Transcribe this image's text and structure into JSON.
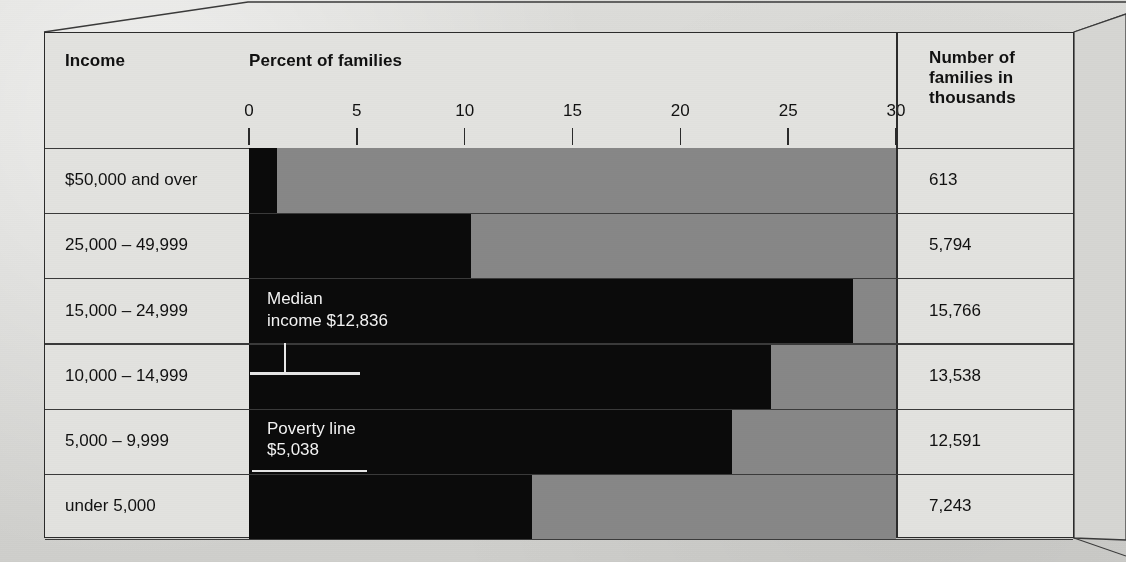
{
  "header": {
    "income_label": "Income",
    "percent_label": "Percent of families",
    "number_label": "Number of\nfamilies in\nthousands"
  },
  "annotations": {
    "median": {
      "text": "Median\nincome $12,836",
      "value": 12836,
      "label": "Median income"
    },
    "poverty": {
      "text": "Poverty line\n$5,038",
      "value": 5038,
      "label": "Poverty line"
    }
  },
  "colors": {
    "bar_dark": "#0b0b0b",
    "bar_light": "#878787",
    "paper": "#d8d8d6",
    "cell": "#e2e2df",
    "rule": "#2b2b2b",
    "annotation_text": "#f2f2f2"
  },
  "chart_data": {
    "type": "bar",
    "title": "Percent of families",
    "subtitle": "",
    "xlabel": "Percent of families",
    "ylabel": "Income",
    "orientation": "horizontal",
    "stacked": true,
    "grid": false,
    "legend": "none",
    "xlim": [
      0,
      30
    ],
    "xticks": [
      0,
      5,
      10,
      15,
      20,
      25,
      30
    ],
    "xtick_labels": [
      "0",
      "5",
      "10",
      "15",
      "20",
      "25",
      "30"
    ],
    "categories": [
      "$50,000 and over",
      "25,000 – 49,999",
      "15,000 – 24,999",
      "10,000 – 14,999",
      "5,000 – 9,999",
      "under 5,000"
    ],
    "series": [
      {
        "name": "Percent of families",
        "values": [
          1.3,
          10.3,
          28.0,
          24.2,
          22.4,
          13.1
        ]
      }
    ],
    "counts_thousands": [
      613,
      5794,
      15766,
      13538,
      12591,
      7243
    ],
    "annotations": [
      {
        "label": "Median income $12,836",
        "row": "10,000 – 14,999"
      },
      {
        "label": "Poverty line $5,038",
        "row": "5,000 – 9,999"
      }
    ]
  },
  "rows": [
    {
      "label": "$50,000 and over",
      "percent": 1.3,
      "count": "613"
    },
    {
      "label": "25,000 – 49,999",
      "percent": 10.3,
      "count": "5,794"
    },
    {
      "label": "15,000 – 24,999",
      "percent": 28.0,
      "count": "15,766"
    },
    {
      "label": "10,000 – 14,999",
      "percent": 24.2,
      "count": "13,538"
    },
    {
      "label": "5,000 – 9,999",
      "percent": 22.4,
      "count": "12,591"
    },
    {
      "label": "under 5,000",
      "percent": 13.1,
      "count": "7,243"
    }
  ],
  "axis": {
    "ticks": [
      "0",
      "5",
      "10",
      "15",
      "20",
      "25",
      "30"
    ]
  }
}
